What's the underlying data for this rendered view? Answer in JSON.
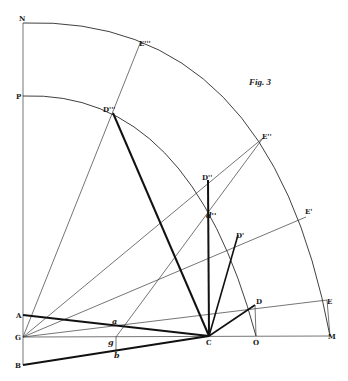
{
  "figure": {
    "title": "Fig. 3",
    "colors": {
      "ink": "#111111",
      "thin_line": "#3a3a3a",
      "background": "#ffffff"
    },
    "points": {
      "N": {
        "label": "N",
        "x": 23,
        "y": 23
      },
      "P": {
        "label": "P",
        "x": 23,
        "y": 96
      },
      "A": {
        "label": "A",
        "x": 23,
        "y": 315
      },
      "G": {
        "label": "G",
        "x": 23,
        "y": 337
      },
      "B": {
        "label": "B",
        "x": 23,
        "y": 365
      },
      "C": {
        "label": "C",
        "x": 209,
        "y": 336
      },
      "O": {
        "label": "O",
        "x": 256,
        "y": 336
      },
      "M": {
        "label": "M",
        "x": 330,
        "y": 336
      },
      "D": {
        "label": "D",
        "x": 255,
        "y": 305
      },
      "D1": {
        "label": "D'",
        "x": 238,
        "y": 235
      },
      "D2": {
        "label": "D''",
        "x": 208,
        "y": 180
      },
      "D3": {
        "label": "D'''",
        "x": 113,
        "y": 113
      },
      "E": {
        "label": "E",
        "x": 327,
        "y": 300
      },
      "E1": {
        "label": "E'",
        "x": 306,
        "y": 217
      },
      "E2": {
        "label": "E''",
        "x": 263,
        "y": 138
      },
      "E3": {
        "label": "E'''",
        "x": 141,
        "y": 41
      },
      "a": {
        "label": "a",
        "x": 115,
        "y": 325
      },
      "g": {
        "label": "g",
        "x": 116,
        "y": 337
      },
      "b": {
        "label": "b",
        "x": 116,
        "y": 352
      },
      "d2": {
        "label": "d''",
        "x": 208,
        "y": 215
      }
    },
    "labels": {
      "N": "N",
      "P": "P",
      "A": "A",
      "G": "G",
      "B": "B",
      "C": "C",
      "O": "O",
      "M": "M",
      "D": "D",
      "D1": "D'",
      "D2": "D''",
      "D3": "D'''",
      "E": "E",
      "E1": "E'",
      "E2": "E''",
      "E3": "E'''",
      "a": "a",
      "g": "g",
      "b": "b",
      "d2": "d''"
    },
    "arcs": [
      {
        "name": "inner-arc",
        "center": "G",
        "from": "P",
        "to": "O",
        "through": [
          "D3",
          "D2",
          "D1",
          "D"
        ]
      },
      {
        "name": "outer-arc",
        "center": "G",
        "from": "N",
        "to": "M",
        "through": [
          "E3",
          "E2",
          "E1",
          "E"
        ]
      }
    ],
    "segments": {
      "thin": [
        [
          "N",
          "G"
        ],
        [
          "G",
          "M"
        ],
        [
          "G",
          "E3"
        ],
        [
          "G",
          "E2"
        ],
        [
          "G",
          "E1"
        ],
        [
          "G",
          "E"
        ],
        [
          "g",
          "E2"
        ],
        [
          "g",
          "b"
        ],
        [
          "D",
          "O"
        ],
        [
          "E",
          "M"
        ]
      ],
      "thick": [
        [
          "A",
          "C"
        ],
        [
          "B",
          "C"
        ],
        [
          "C",
          "D3"
        ],
        [
          "C",
          "D2"
        ],
        [
          "C",
          "D1"
        ],
        [
          "C",
          "D"
        ]
      ]
    }
  }
}
